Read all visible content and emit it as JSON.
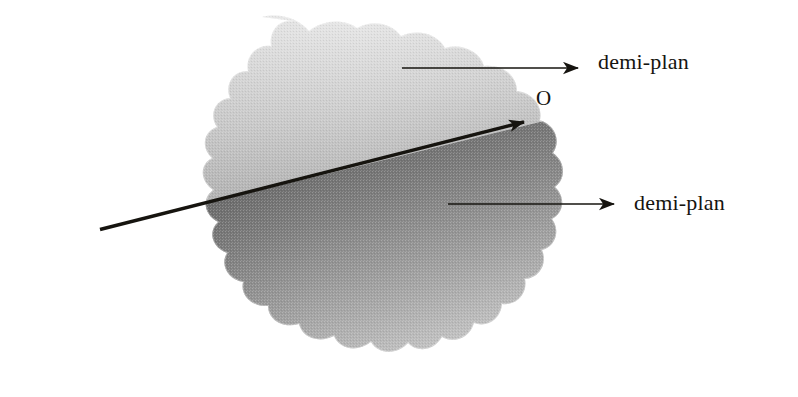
{
  "figure": {
    "background_color": "#ffffff",
    "width": 798,
    "height": 397,
    "ink_color": "#16140f"
  },
  "labels": {
    "upper_halfplane": "demi-plan",
    "lower_halfplane": "demi-plan",
    "origin_point": "O"
  },
  "region": {
    "name": "plane-blob",
    "description": "irregular scalloped cloud-shaped region representing a plane",
    "upper_fill_light": "#f2f2f2",
    "upper_fill_dark": "#7a7a7a",
    "lower_fill_dark": "#4a4a4a",
    "lower_fill_light": "#efefef",
    "bounds": {
      "x": 38,
      "y": 16,
      "width": 525,
      "height": 346
    }
  },
  "divider": {
    "name": "separating-line",
    "start": {
      "x": 100,
      "y": 229
    },
    "end": {
      "x": 540,
      "y": 118
    },
    "stroke_width": 3.2,
    "color": "#16140f",
    "has_arrowhead": true
  },
  "leaders": [
    {
      "name": "upper-leader",
      "start": {
        "x": 402,
        "y": 68
      },
      "end": {
        "x": 596,
        "y": 68
      },
      "color": "#16140f"
    },
    {
      "name": "lower-leader",
      "start": {
        "x": 448,
        "y": 204
      },
      "end": {
        "x": 632,
        "y": 204
      },
      "color": "#16140f"
    }
  ]
}
